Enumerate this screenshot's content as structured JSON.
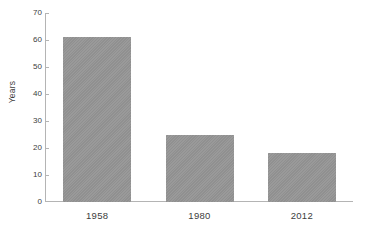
{
  "chart_data": {
    "type": "bar",
    "title": "",
    "subtitle": "",
    "xlabel": "",
    "ylabel": "Years",
    "categories": [
      "1958",
      "1980",
      "2012"
    ],
    "values": [
      61,
      25,
      18
    ],
    "ylim": [
      0,
      70
    ],
    "y_ticks": [
      0,
      10,
      20,
      30,
      40,
      50,
      60,
      70
    ],
    "y_tick_labels": [
      "0",
      "10",
      "20",
      "30",
      "40",
      "50",
      "60",
      "70"
    ],
    "grid": false,
    "legend": null,
    "legend_position": "none",
    "annotations": [],
    "series": [
      {
        "name": "",
        "values": [
          61,
          25,
          18
        ]
      }
    ],
    "colors": {
      "bar_fill": "#959595",
      "axis_line": "#b4b4b4",
      "text": "#3d3d3d",
      "background": "#ffffff"
    }
  }
}
